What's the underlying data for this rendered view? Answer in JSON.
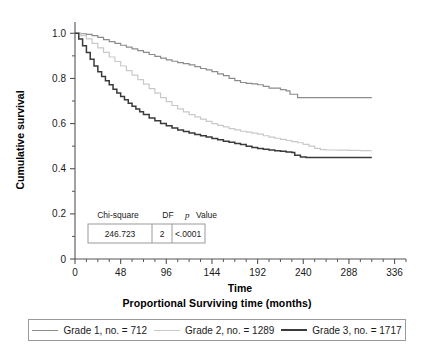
{
  "chart_data": {
    "type": "line",
    "title": "",
    "subtitle": "",
    "caption": "Proportional Surviving time (months)",
    "xlabel": "Time",
    "ylabel": "Cumulative survival",
    "xlim": [
      0,
      348
    ],
    "ylim": [
      0,
      1.05
    ],
    "xticks": [
      0,
      48,
      96,
      144,
      192,
      240,
      288,
      336
    ],
    "xticklabels": [
      "0",
      "48",
      "96",
      "144",
      "192",
      "240",
      "288",
      "336"
    ],
    "xminortick_step": 12,
    "yticks": [
      0,
      0.2,
      0.4,
      0.6,
      0.8,
      1.0
    ],
    "yticklabels": [
      "0",
      "0.2",
      "0.4",
      "0.6",
      "0.8",
      "1.0"
    ],
    "yminortick_step": 0.1,
    "grid": false,
    "legend_position": "bottom",
    "series": [
      {
        "name": "Grade 1, no. = 712",
        "color": "#8c8c8c",
        "final_value": 0.715,
        "points": [
          [
            0,
            1.0
          ],
          [
            6,
            0.998
          ],
          [
            12,
            0.995
          ],
          [
            18,
            0.99
          ],
          [
            24,
            0.982
          ],
          [
            30,
            0.972
          ],
          [
            36,
            0.963
          ],
          [
            42,
            0.955
          ],
          [
            48,
            0.947
          ],
          [
            54,
            0.939
          ],
          [
            60,
            0.931
          ],
          [
            66,
            0.923
          ],
          [
            72,
            0.915
          ],
          [
            78,
            0.906
          ],
          [
            84,
            0.898
          ],
          [
            90,
            0.89
          ],
          [
            96,
            0.882
          ],
          [
            102,
            0.876
          ],
          [
            108,
            0.87
          ],
          [
            114,
            0.866
          ],
          [
            120,
            0.86
          ],
          [
            126,
            0.852
          ],
          [
            132,
            0.844
          ],
          [
            138,
            0.838
          ],
          [
            144,
            0.83
          ],
          [
            150,
            0.82
          ],
          [
            156,
            0.812
          ],
          [
            162,
            0.8
          ],
          [
            168,
            0.79
          ],
          [
            174,
            0.782
          ],
          [
            180,
            0.778
          ],
          [
            186,
            0.776
          ],
          [
            192,
            0.772
          ],
          [
            198,
            0.765
          ],
          [
            204,
            0.757
          ],
          [
            210,
            0.757
          ],
          [
            216,
            0.75
          ],
          [
            222,
            0.745
          ],
          [
            224,
            0.745
          ],
          [
            226,
            0.73
          ],
          [
            232,
            0.73
          ],
          [
            234,
            0.715
          ],
          [
            312,
            0.715
          ]
        ]
      },
      {
        "name": "Grade 2, no. = 1289",
        "color": "#c9c9c9",
        "final_value": 0.48,
        "points": [
          [
            0,
            1.0
          ],
          [
            6,
            0.99
          ],
          [
            12,
            0.975
          ],
          [
            18,
            0.955
          ],
          [
            24,
            0.935
          ],
          [
            30,
            0.915
          ],
          [
            36,
            0.895
          ],
          [
            42,
            0.875
          ],
          [
            48,
            0.855
          ],
          [
            54,
            0.835
          ],
          [
            60,
            0.815
          ],
          [
            66,
            0.795
          ],
          [
            72,
            0.775
          ],
          [
            78,
            0.755
          ],
          [
            84,
            0.735
          ],
          [
            90,
            0.715
          ],
          [
            96,
            0.697
          ],
          [
            102,
            0.68
          ],
          [
            108,
            0.665
          ],
          [
            114,
            0.652
          ],
          [
            120,
            0.64
          ],
          [
            126,
            0.63
          ],
          [
            132,
            0.62
          ],
          [
            138,
            0.61
          ],
          [
            144,
            0.6
          ],
          [
            150,
            0.592
          ],
          [
            156,
            0.585
          ],
          [
            162,
            0.578
          ],
          [
            168,
            0.572
          ],
          [
            174,
            0.566
          ],
          [
            180,
            0.562
          ],
          [
            186,
            0.558
          ],
          [
            192,
            0.553
          ],
          [
            198,
            0.546
          ],
          [
            204,
            0.54
          ],
          [
            210,
            0.535
          ],
          [
            216,
            0.53
          ],
          [
            222,
            0.525
          ],
          [
            228,
            0.52
          ],
          [
            234,
            0.515
          ],
          [
            240,
            0.508
          ],
          [
            246,
            0.5
          ],
          [
            252,
            0.49
          ],
          [
            258,
            0.485
          ],
          [
            264,
            0.483
          ],
          [
            276,
            0.482
          ],
          [
            288,
            0.481
          ],
          [
            300,
            0.48
          ],
          [
            312,
            0.48
          ]
        ]
      },
      {
        "name": "Grade 3, no. = 1717",
        "color": "#3a3a3a",
        "final_value": 0.45,
        "points": [
          [
            0,
            1.0
          ],
          [
            4,
            0.975
          ],
          [
            8,
            0.945
          ],
          [
            12,
            0.915
          ],
          [
            16,
            0.885
          ],
          [
            20,
            0.855
          ],
          [
            24,
            0.83
          ],
          [
            28,
            0.808
          ],
          [
            32,
            0.79
          ],
          [
            36,
            0.772
          ],
          [
            40,
            0.752
          ],
          [
            44,
            0.735
          ],
          [
            48,
            0.72
          ],
          [
            52,
            0.705
          ],
          [
            56,
            0.69
          ],
          [
            60,
            0.677
          ],
          [
            64,
            0.665
          ],
          [
            68,
            0.652
          ],
          [
            72,
            0.64
          ],
          [
            78,
            0.625
          ],
          [
            84,
            0.612
          ],
          [
            90,
            0.6
          ],
          [
            96,
            0.59
          ],
          [
            102,
            0.58
          ],
          [
            108,
            0.572
          ],
          [
            114,
            0.565
          ],
          [
            120,
            0.558
          ],
          [
            126,
            0.552
          ],
          [
            132,
            0.546
          ],
          [
            138,
            0.54
          ],
          [
            144,
            0.534
          ],
          [
            150,
            0.528
          ],
          [
            156,
            0.522
          ],
          [
            162,
            0.517
          ],
          [
            168,
            0.512
          ],
          [
            174,
            0.507
          ],
          [
            180,
            0.5
          ],
          [
            186,
            0.494
          ],
          [
            192,
            0.49
          ],
          [
            198,
            0.486
          ],
          [
            204,
            0.483
          ],
          [
            210,
            0.48
          ],
          [
            216,
            0.477
          ],
          [
            222,
            0.474
          ],
          [
            228,
            0.472
          ],
          [
            231,
            0.46
          ],
          [
            237,
            0.452
          ],
          [
            243,
            0.45
          ],
          [
            270,
            0.45
          ],
          [
            300,
            0.45
          ],
          [
            312,
            0.45
          ]
        ]
      }
    ],
    "annotation_table": {
      "headers": [
        "Chi-square",
        "DF",
        "p Value"
      ],
      "header_p_italic": "p",
      "header_p_rest": "Value",
      "values": [
        "246.723",
        "2",
        "<.0001"
      ]
    }
  },
  "legend": {
    "items": [
      {
        "label": "Grade 1, no. = 712",
        "color": "#8c8c8c"
      },
      {
        "label": "Grade 2, no. = 1289",
        "color": "#c9c9c9"
      },
      {
        "label": "Grade 3, no. = 1717",
        "color": "#3a3a3a"
      }
    ]
  },
  "colors": {
    "axis": "#555555",
    "text": "#1a1a1a",
    "table_border": "#9a9a9a",
    "background": "#ffffff"
  }
}
